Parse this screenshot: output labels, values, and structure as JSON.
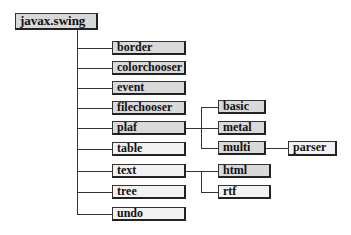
{
  "diagram": {
    "type": "package-tree",
    "root": {
      "label": "javax.swing"
    },
    "level1": [
      {
        "label": "border",
        "style": "gray"
      },
      {
        "label": "colorchooser",
        "style": "gray"
      },
      {
        "label": "event",
        "style": "gray"
      },
      {
        "label": "filechooser",
        "style": "gray"
      },
      {
        "label": "plaf",
        "style": "gray"
      },
      {
        "label": "table",
        "style": "light"
      },
      {
        "label": "text",
        "style": "light"
      },
      {
        "label": "tree",
        "style": "light"
      },
      {
        "label": "undo",
        "style": "light"
      }
    ],
    "plaf_children": [
      {
        "label": "basic",
        "style": "gray"
      },
      {
        "label": "metal",
        "style": "gray"
      },
      {
        "label": "multi",
        "style": "gray"
      }
    ],
    "text_children": [
      {
        "label": "html",
        "style": "gray"
      },
      {
        "label": "rtf",
        "style": "light"
      }
    ],
    "multi_children": [
      {
        "label": "parser",
        "style": "light"
      }
    ],
    "colors": {
      "line": "#333333",
      "gray_fill": "#d9d9d9",
      "light_fill": "#f2f2f2",
      "border": "#222222"
    }
  }
}
